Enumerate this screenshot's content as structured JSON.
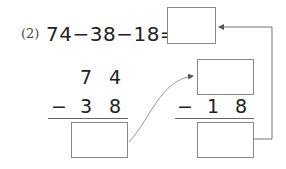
{
  "problem": {
    "number_label": "(2)",
    "expression": "74−38−18=",
    "answer_box_value": ""
  },
  "step1": {
    "top_digits": [
      "7",
      "4"
    ],
    "operator": "−",
    "bottom_digits": [
      "3",
      "8"
    ],
    "result_box_value": ""
  },
  "step2": {
    "top_box_value": "",
    "operator": "−",
    "bottom_digits": [
      "1",
      "8"
    ],
    "result_box_value": ""
  },
  "colors": {
    "text": "#222222",
    "box_border": "#888888",
    "arrow": "#777777"
  }
}
